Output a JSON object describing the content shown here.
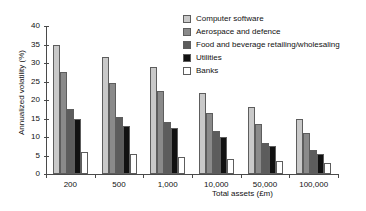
{
  "chart_data": {
    "type": "bar",
    "title": "",
    "xlabel": "Total assets (£m)",
    "ylabel": "Annualized volatility (%)",
    "categories": [
      "200",
      "500",
      "1,000",
      "10,000",
      "50,000",
      "100,000"
    ],
    "ylim": [
      0,
      40
    ],
    "yticks": [
      "0",
      "5",
      "10",
      "15",
      "20",
      "25",
      "30",
      "35",
      "40"
    ],
    "grid": false,
    "legend_position": "top-right",
    "series": [
      {
        "name": "Computer software",
        "color": "#c9c9c9",
        "values": [
          35,
          31.5,
          29,
          22,
          18,
          15
        ]
      },
      {
        "name": "Aerospace and defence",
        "color": "#8a8a8a",
        "values": [
          27.5,
          24.5,
          22.5,
          16.5,
          13.5,
          11
        ]
      },
      {
        "name": "Food and beverage retailing/wholesaling",
        "color": "#5c5c5c",
        "values": [
          17.5,
          15.5,
          14,
          11.5,
          8.5,
          6.5
        ]
      },
      {
        "name": "Utilities",
        "color": "#111111",
        "values": [
          15,
          13,
          12.5,
          10,
          7.5,
          5.5
        ]
      },
      {
        "name": "Banks",
        "color": "#ffffff",
        "values": [
          6,
          5.5,
          4.5,
          4,
          3.5,
          3
        ]
      }
    ]
  }
}
